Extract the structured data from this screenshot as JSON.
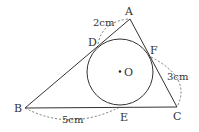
{
  "diagram": {
    "points": {
      "A": {
        "label": "A",
        "x": 130,
        "y": 19
      },
      "B": {
        "label": "B",
        "x": 25,
        "y": 108
      },
      "C": {
        "label": "C",
        "x": 177,
        "y": 107
      },
      "D": {
        "label": "D",
        "x": 98,
        "y": 44
      },
      "E": {
        "label": "E",
        "x": 120,
        "y": 107
      },
      "F": {
        "label": "F",
        "x": 150,
        "y": 57
      },
      "O": {
        "label": "O",
        "x": 120,
        "y": 72
      }
    },
    "circle": {
      "center": "O",
      "radius": 33
    },
    "measurements": {
      "AD": "2cm",
      "CF": "3cm",
      "BE": "5cm"
    },
    "colors": {
      "stroke": "#333333",
      "dashed": "#555555"
    }
  }
}
